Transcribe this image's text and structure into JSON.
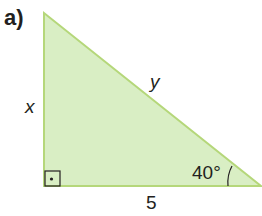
{
  "problem": {
    "label": "a)"
  },
  "triangle": {
    "fill": "#d9eec4",
    "stroke": "#b5d77a",
    "side_vertical": "x",
    "hypotenuse": "y",
    "side_horizontal": "5",
    "angle": "40°",
    "right_angle_marker": "right-angle-square-with-dot"
  }
}
